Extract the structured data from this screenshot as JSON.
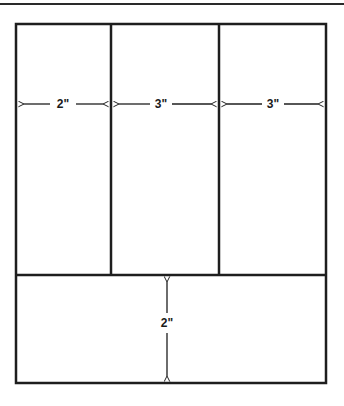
{
  "diagram": {
    "colors": {
      "line": "#1e1e1e",
      "background": "#ffffff"
    },
    "outer_box": {
      "x": 16,
      "y": 24,
      "width": 310,
      "height": 359
    },
    "top_columns": [
      {
        "label": "2\"",
        "x1": 16,
        "x2": 111
      },
      {
        "label": "3\"",
        "x1": 111,
        "x2": 219
      },
      {
        "label": "3\"",
        "x1": 219,
        "x2": 326
      }
    ],
    "bottom_panel": {
      "label": "2\"",
      "y1": 275,
      "y2": 383
    },
    "dimensions": {
      "col1_width": "2\"",
      "col2_width": "3\"",
      "col3_width": "3\"",
      "bottom_height": "2\""
    }
  }
}
